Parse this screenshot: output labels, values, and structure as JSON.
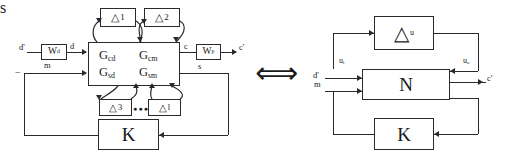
{
  "figure": {
    "kind": "block-diagram",
    "equivalence_symbol": "⟺",
    "left": {
      "title_hidden": "",
      "plant_block": {
        "entries": [
          [
            "G",
            "cd",
            "G",
            "cm"
          ],
          [
            "G",
            "sd",
            "G",
            "sm"
          ]
        ],
        "label_cd": "G",
        "sub_cd": "cd",
        "label_cm": "G",
        "sub_cm": "cm",
        "label_sd": "G",
        "sub_sd": "sd",
        "label_sm": "G",
        "sub_sm": "sm"
      },
      "weight_d": {
        "label": "W",
        "sub": "d"
      },
      "weight_p": {
        "label": "W",
        "sub": "p"
      },
      "controller": {
        "label": "K"
      },
      "uncertainty_top": [
        {
          "symbol": "△",
          "index": "1"
        },
        {
          "symbol": "△",
          "index": "2"
        }
      ],
      "uncertainty_bottom": [
        {
          "symbol": "△",
          "index": "3"
        },
        {
          "symbol": "△",
          "index": "l"
        }
      ],
      "ellipsis": "●●●",
      "signals": {
        "d_prime": "d'",
        "d": "d",
        "m": "m",
        "minus": "−",
        "c": "c",
        "c_prime": "c'",
        "s": "s"
      }
    },
    "right": {
      "uncertainty_block": {
        "symbol": "△",
        "sub": "u"
      },
      "plant_block": {
        "label": "N"
      },
      "controller": {
        "label": "K"
      },
      "signals": {
        "u_i": "u",
        "u_i_sub": "i",
        "u_o": "u",
        "u_o_sub": "o",
        "d_prime": "d'",
        "m": "m",
        "c_prime": "c'",
        "s": "s"
      }
    },
    "colors": {
      "ink": "#2a2a2a",
      "background": "#ffffff"
    }
  }
}
